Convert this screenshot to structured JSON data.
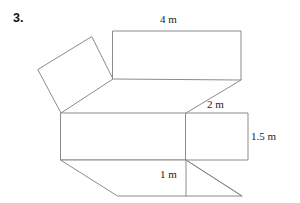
{
  "problem": {
    "number": "3."
  },
  "figure": {
    "name": "net-of-a-prism",
    "stroke_color": "#8b8b8b",
    "fill_color": "#ffffff",
    "labels": [
      {
        "id": "top",
        "text": "4 m",
        "x": 160,
        "y": 13,
        "edge": "top-rectangle-top-edge"
      },
      {
        "id": "slant",
        "text": "2 m",
        "x": 207,
        "y": 98,
        "edge": "slant-edge"
      },
      {
        "id": "right",
        "text": "1.5 m",
        "x": 251,
        "y": 130,
        "edge": "right-square-right-edge"
      },
      {
        "id": "bottom",
        "text": "1 m",
        "x": 160,
        "y": 168,
        "edge": "bottom-vertical-edge"
      }
    ],
    "shapes": [
      {
        "id": "tilted-square",
        "name": "tilted-square-face",
        "points": "92,37 113,79 61,113 38,70"
      },
      {
        "id": "top-rectangle",
        "name": "top-rectangle-face",
        "points": "113,31 241,31 241,80 113,79"
      },
      {
        "id": "main-rectangle",
        "name": "main-rectangle-face",
        "points": "61,113 186,113 186,160 61,160"
      },
      {
        "id": "right-square",
        "name": "right-square-face",
        "points": "186,113 248,113 248,160 186,160"
      },
      {
        "id": "bottom-parallelogram",
        "name": "bottom-parallelogram-face",
        "points": "61,160 186,160 242,196 118,196"
      }
    ],
    "connectors": [
      {
        "id": "slant-edge",
        "name": "slant-connector-edge",
        "x1": 241,
        "y1": 80,
        "x2": 186,
        "y2": 113
      },
      {
        "id": "bottom-diagonal",
        "name": "bottom-diagonal-edge",
        "x1": 186,
        "y1": 160,
        "x2": 242,
        "y2": 196
      },
      {
        "id": "bottom-vertical",
        "name": "bottom-vertical-edge",
        "x1": 186,
        "y1": 160,
        "x2": 186,
        "y2": 196
      }
    ]
  }
}
